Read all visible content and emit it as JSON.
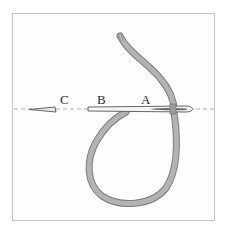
{
  "diagram": {
    "type": "embroidery stitch illustration",
    "labels": {
      "a": "A",
      "b": "B",
      "c": "C"
    },
    "elements": [
      "needle",
      "thread-loop",
      "stitch-guide-line",
      "needle-tip"
    ],
    "colors": {
      "frame": "#c4c4c4",
      "thread": "#a9a9a9",
      "thread_edge": "#7d7d7d",
      "needle": "#f4f4f4",
      "needle_edge": "#555555",
      "guide": "#9a9a9a",
      "label": "#2a2a2a"
    }
  }
}
